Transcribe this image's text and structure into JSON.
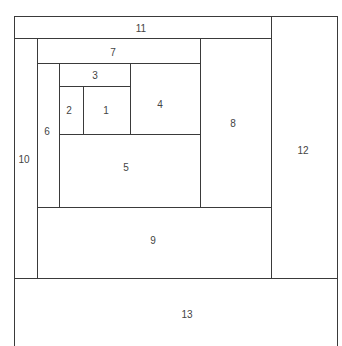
{
  "diagram": {
    "type": "nested-rectangle-spiral",
    "line_color": "#3a3a3a",
    "text_color": "#444444",
    "background": "#ffffff",
    "regions": [
      {
        "id": "1",
        "label": "1",
        "x": 83,
        "y": 86,
        "w": 47,
        "h": 48,
        "cx": 106,
        "cy": 110
      },
      {
        "id": "2",
        "label": "2",
        "x": 59,
        "y": 86,
        "w": 24,
        "h": 48,
        "cx": 69,
        "cy": 110
      },
      {
        "id": "3",
        "label": "3",
        "x": 59,
        "y": 63,
        "w": 71,
        "h": 23,
        "cx": 95,
        "cy": 75
      },
      {
        "id": "4",
        "label": "4",
        "x": 130,
        "y": 63,
        "w": 70,
        "h": 71,
        "cx": 160,
        "cy": 104
      },
      {
        "id": "5",
        "label": "5",
        "x": 59,
        "y": 134,
        "w": 141,
        "h": 73,
        "cx": 126,
        "cy": 167
      },
      {
        "id": "6",
        "label": "6",
        "x": 37,
        "y": 63,
        "w": 22,
        "h": 144,
        "cx": 47,
        "cy": 131
      },
      {
        "id": "7",
        "label": "7",
        "x": 37,
        "y": 38,
        "w": 163,
        "h": 25,
        "cx": 113,
        "cy": 52
      },
      {
        "id": "8",
        "label": "8",
        "x": 200,
        "y": 38,
        "w": 71,
        "h": 169,
        "cx": 233,
        "cy": 123
      },
      {
        "id": "9",
        "label": "9",
        "x": 37,
        "y": 207,
        "w": 234,
        "h": 71,
        "cx": 153,
        "cy": 240
      },
      {
        "id": "10",
        "label": "10",
        "x": 14,
        "y": 38,
        "w": 23,
        "h": 240,
        "cx": 24,
        "cy": 159
      },
      {
        "id": "11",
        "label": "11",
        "x": 14,
        "y": 16,
        "w": 257,
        "h": 22,
        "cx": 141,
        "cy": 28
      },
      {
        "id": "12",
        "label": "12",
        "x": 271,
        "y": 16,
        "w": 67,
        "h": 262,
        "cx": 303,
        "cy": 150
      },
      {
        "id": "13",
        "label": "13",
        "x": 14,
        "y": 278,
        "w": 324,
        "h": 68,
        "cx": 187,
        "cy": 314
      }
    ],
    "lines": [
      {
        "x": 14,
        "y": 16,
        "w": 324,
        "h": 1.3
      },
      {
        "x": 14,
        "y": 16,
        "w": 1.3,
        "h": 330
      },
      {
        "x": 337,
        "y": 16,
        "w": 1.3,
        "h": 330
      },
      {
        "x": 270.5,
        "y": 16,
        "w": 1.3,
        "h": 262
      },
      {
        "x": 14,
        "y": 38,
        "w": 257,
        "h": 1.3
      },
      {
        "x": 36.5,
        "y": 38,
        "w": 1.3,
        "h": 240
      },
      {
        "x": 37,
        "y": 63,
        "w": 163,
        "h": 1.3
      },
      {
        "x": 199.5,
        "y": 38,
        "w": 1.3,
        "h": 169
      },
      {
        "x": 58.5,
        "y": 63,
        "w": 1.3,
        "h": 144
      },
      {
        "x": 59,
        "y": 86,
        "w": 71,
        "h": 1.3
      },
      {
        "x": 129.5,
        "y": 63,
        "w": 1.3,
        "h": 71
      },
      {
        "x": 82.5,
        "y": 86,
        "w": 1.3,
        "h": 48
      },
      {
        "x": 59,
        "y": 134,
        "w": 141,
        "h": 1.3
      },
      {
        "x": 37,
        "y": 207,
        "w": 234,
        "h": 1.3
      },
      {
        "x": 14,
        "y": 277.5,
        "w": 324,
        "h": 1.3
      }
    ]
  }
}
